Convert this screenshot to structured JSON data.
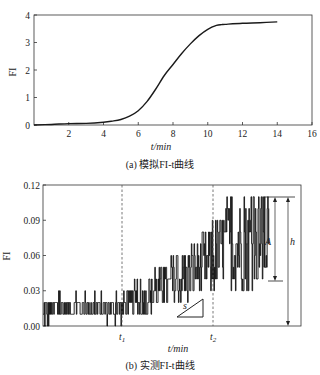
{
  "chart_data": [
    {
      "id": "a",
      "type": "line",
      "title": "",
      "caption": "(a) 模拟FI-t曲线",
      "xlabel": "t/min",
      "ylabel": "FI",
      "xlim": [
        0,
        16
      ],
      "ylim": [
        0,
        4
      ],
      "xticks": [
        2,
        4,
        6,
        8,
        10,
        12,
        14,
        16
      ],
      "yticks": [
        0,
        1,
        2,
        3,
        4
      ],
      "grid": false,
      "series": [
        {
          "name": "模拟FI",
          "x": [
            0,
            1,
            2,
            3,
            4,
            4.5,
            5,
            5.5,
            6,
            6.5,
            7,
            7.5,
            8,
            8.5,
            9,
            9.5,
            10,
            10.5,
            10.8,
            11,
            12,
            13,
            14
          ],
          "y": [
            0,
            0.02,
            0.05,
            0.06,
            0.1,
            0.14,
            0.2,
            0.32,
            0.52,
            0.85,
            1.3,
            1.8,
            2.2,
            2.6,
            2.95,
            3.25,
            3.48,
            3.62,
            3.65,
            3.66,
            3.7,
            3.72,
            3.75
          ]
        }
      ]
    },
    {
      "id": "b",
      "type": "line",
      "title": "",
      "caption": "(b) 实测FI-t曲线",
      "xlabel": "t/min",
      "ylabel": "FI",
      "ylim": [
        0,
        0.12
      ],
      "yticks": [
        "0.00",
        "0.03",
        "0.06",
        "0.09",
        "0.12"
      ],
      "xticks": [
        "t1",
        "t2"
      ],
      "xtick_positions_fraction": [
        0.305,
        0.655
      ],
      "grid": false,
      "annotations": {
        "vlines_dashed": [
          "t1",
          "t2"
        ],
        "slope_label": "s",
        "amplitude_label": "A",
        "height_label": "h",
        "A_range": [
          0.038,
          0.109
        ],
        "h_range": [
          0.0,
          0.109
        ]
      },
      "series": [
        {
          "name": "实测FI (noisy stepwise)",
          "baseline_fraction_x": [
            0.0,
            0.05,
            0.1,
            0.2,
            0.3,
            0.35,
            0.4,
            0.45,
            0.5,
            0.55,
            0.6,
            0.65,
            0.7,
            0.75,
            0.8,
            0.85,
            0.875
          ],
          "baseline_y": [
            0.01,
            0.015,
            0.015,
            0.015,
            0.015,
            0.02,
            0.02,
            0.03,
            0.035,
            0.04,
            0.05,
            0.055,
            0.065,
            0.07,
            0.07,
            0.07,
            0.07
          ],
          "noise_amplitude": [
            0.015,
            0.01,
            0.01,
            0.01,
            0.012,
            0.015,
            0.015,
            0.018,
            0.02,
            0.022,
            0.025,
            0.028,
            0.035,
            0.04,
            0.04,
            0.04,
            0.04
          ]
        }
      ]
    }
  ],
  "labels": {
    "a_caption": "(a) 模拟FI-t曲线",
    "b_caption": "(b) 实测FI-t曲线",
    "a_xlabel": "t/min",
    "b_xlabel": "t/min",
    "a_ylabel": "FI",
    "b_ylabel": "FI",
    "t1": "t",
    "t1_sub": "1",
    "t2": "t",
    "t2_sub": "2",
    "s": "s",
    "A": "A",
    "h": "h"
  }
}
